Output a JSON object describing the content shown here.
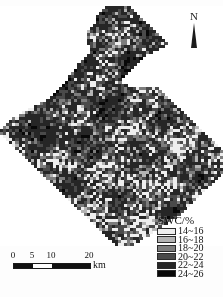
{
  "figure": {
    "kind": "thematic-raster-map",
    "background_color": "#ffffff"
  },
  "north_arrow": {
    "label": "N",
    "icon": "north-arrow-icon",
    "color": "#1c1c1c"
  },
  "legend": {
    "title": "SWC/%",
    "items": [
      {
        "label": "14~16",
        "color": "#eeeeee"
      },
      {
        "label": "16~18",
        "color": "#b4b4b4"
      },
      {
        "label": "18~20",
        "color": "#7d7d7d"
      },
      {
        "label": "20~22",
        "color": "#4a4a4a"
      },
      {
        "label": "22~24",
        "color": "#262626"
      },
      {
        "label": "24~26",
        "color": "#080808"
      }
    ]
  },
  "scale_bar": {
    "ticks": [
      {
        "label": "0",
        "pos_px": 0
      },
      {
        "label": "5",
        "pos_px": 19
      },
      {
        "label": "10",
        "pos_px": 38
      },
      {
        "label": "20",
        "pos_px": 76
      }
    ],
    "segments": [
      {
        "from": "0",
        "to": "5",
        "fill": "dark",
        "left_px": 0,
        "width_px": 19
      },
      {
        "from": "5",
        "to": "10",
        "fill": "light",
        "left_px": 19,
        "width_px": 19
      },
      {
        "from": "10",
        "to": "20",
        "fill": "dark",
        "left_px": 38,
        "width_px": 38
      }
    ],
    "unit": "km"
  },
  "chart_data": {
    "type": "heatmap",
    "title": "",
    "xlabel": "",
    "ylabel": "",
    "legend_title": "SWC/%",
    "legend_position": "bottom-right",
    "grid": false,
    "value_unit": "%",
    "classes": [
      {
        "range": [
          14,
          16
        ],
        "label": "14~16",
        "color": "#eeeeee"
      },
      {
        "range": [
          16,
          18
        ],
        "label": "16~18",
        "color": "#b4b4b4"
      },
      {
        "range": [
          18,
          20
        ],
        "label": "18~20",
        "color": "#7d7d7d"
      },
      {
        "range": [
          20,
          22
        ],
        "label": "20~22",
        "color": "#4a4a4a"
      },
      {
        "range": [
          22,
          24
        ],
        "label": "22~24",
        "color": "#262626"
      },
      {
        "range": [
          24,
          26
        ],
        "label": "24~26",
        "color": "#080808"
      }
    ],
    "nodata_color": "#ffffff",
    "cell_px": 3,
    "grid_cols": 74,
    "grid_rows": 80,
    "class_share_estimate": [
      0.03,
      0.04,
      0.07,
      0.13,
      0.3,
      0.43
    ],
    "shape_mask_rows": [
      "000000000000000000000000000000000011111111000000000000000000000000000000",
      "000000000000000000000000000000000111111111100000000000000000000000000000",
      "000000000000000000000000000000001111111111110000000000000000000000000000",
      "000000000000000000000000000000011111111111111000000000000000000000000000",
      "000000000000000000000000000000011111111111111100000000000000000000000000",
      "000000000000000000000000000000011111111111111110000000000000000000000000",
      "000000000000000000000000000000111111111111111111000000000000000000000000",
      "000000000000000000000000000001111111111111111111100000000000000000000000",
      "000000000000000000000000000011111111111111111111110000000000000000000000",
      "000000000000000000000000000011111111111111111111111000000000000000000000",
      "000000000000000000000000000011111111111111111111111100000000000000000000",
      "000000000000000000000000000011111111111111111111111110000000000000000000",
      "000000000000000000000000000011111111111111111111111111000000000000000000",
      "000000000000000000000000000001111111111111111111111110000000000000000000",
      "000000000000000000000000000001111111111111111111111000000000000000000000",
      "000000000000000000000000000001111111111111111111100000000000000000000000",
      "000000000000000000000000000011111111111111111110000000000000000000000000",
      "000000000000000000000000000111111111111111111100000000000000000000000000",
      "000000000000000000000000001111111111111111111000000000000000000000000000",
      "000000000000000000000000011111111111111111110000000000000000000000000000",
      "000000000000000000000000011111111111111111100000000000000000000000000000",
      "000000000000000000000000111111111111111111000000000000000000000000000000",
      "000000000000000000000001111111111111111110000000000000000000000000000000",
      "000000000000000000000011111111111111111100000000000000000000000000000000",
      "000000000000000000000011111111111111111000000000000000000000000000000000",
      "000000000000000000000111111111111111111000000000000000000000000000000000",
      "000000000000000000001111111111111111111110000000000000000000000000000000",
      "000000000000000000011111111111111111111111111111111000000000000000000000",
      "000000000000000000111111111111111111111111111111111100000000000000000000",
      "000000000000000001111111111111111111111111111111111110000000000000000000",
      "000000000000000011111111111111111111111111111111111111000000000000000000",
      "000000000000000111111111111111111111111111111111111111100000000000000000",
      "000000000000011111111111111111111111111111111111111111110000000000000000",
      "000000000001111111111111111111111111111111111111111111111000000000000000",
      "000000000111111111111111111111111111111111111111111111111100000000000000",
      "000000011111111111111111111111111111111111111111111111111110000000000000",
      "000000111111111111111111111111111111111111111111111111111111000000000000",
      "000011111111111111111111111111111111111111111111111111111111100000000000",
      "000111111111111111111111111111111111111111111111111111111111110000000000",
      "001111111111111111111111111111111111111111111111111111111111111000000000",
      "011111111111111111111111111111111111111111111111111111111111111100000000",
      "111111111111111111111111111111111111111111111111111111111111111110000000",
      "111111111111111111111111111111111111111111111111111111111111111111000000",
      "011111111111111111111111111111111111111111111111111111111111111111100000",
      "001111111111111111111111111111111111111111111111111111111111111111110000",
      "000111111111111111111111111111111111111111111111111111111111111111111000",
      "000011111111111111111111111111111111111111111111111111111111111111111100",
      "000001111111111111111111111111111111111111111111111111111111111111111110",
      "000000111111111111111111111111111111111111111111111111111111111111111111",
      "000000011111111111111111111111111111111111111111111111111111111111111111",
      "000000001111111111111111111111111111111111111111111111111111111111111111",
      "000000000111111111111111111111111111111111111111111111111111111111111111",
      "000000000011111111111111111111111111111111111111111111111111111111111111",
      "000000000001111111111111111111111111111111111111111111111111111111111111",
      "000000000000111111111111111111111111111111111111111111111111111111111111",
      "000000000000011111111111111111111111111111111111111111111111111111111111",
      "000000000000001111111111111111111111111111111111111111111111111111111110",
      "000000000000000111111111111111111111111111111111111111111111111111111100",
      "000000000000000011111111111111111111111111111111111111111111111111111000",
      "000000000000000001111111111111111111111111111111111111111111111111110000",
      "000000000000000000111111111111111111111111111111111111111111111111100000",
      "000000000000000000011111111111111111111111111111111111111111111111000000",
      "000000000000000000001111111111111111111111111111111111111111111110000000",
      "000000000000000000000111111111111111111111111111111111111111111100000000",
      "000000000000000000000011111111111111111111111111111111111111111000000000",
      "000000000000000000000001111111111111111111111111111111111111110000000000",
      "000000000000000000000000111111111111111111111111111111111111100000000000",
      "000000000000000000000000011111111111111111111111111111111111000000000000",
      "000000000000000000000000001111111111111111111111111111111110000000000000",
      "000000000000000000000000000111111111111111111111111111111100000000000000",
      "000000000000000000000000000011111111111111111111111111111000000000000000",
      "000000000000000000000000000001111111111111111111111111100000000000000000",
      "000000000000000000000000000000111111111111111111111111000000000000000000",
      "000000000000000000000000000000011111111111111111111100000000000000000000",
      "000000000000000000000000000000001111111111111111111000000000000000000000",
      "000000000000000000000000000000000111111111111111100000000000000000000000",
      "000000000000000000000000000000000011111111111111000000000000000000000000",
      "000000000000000000000000000000000001111111111100000000000000000000000000",
      "000000000000000000000000000000000000111111111000000000000000000000000000",
      "000000000000000000000000000000000000011111100000000000000000000000000000"
    ]
  }
}
